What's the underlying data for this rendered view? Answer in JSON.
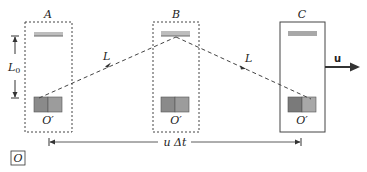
{
  "diagram": {
    "frames": [
      {
        "label": "A",
        "clock_label": "O′",
        "border": "dashed"
      },
      {
        "label": "B",
        "clock_label": "O′",
        "border": "dashed"
      },
      {
        "label": "C",
        "clock_label": "O′",
        "border": "solid"
      }
    ],
    "path_labels": [
      "L",
      "L"
    ],
    "height_label": "L",
    "height_subscript": "0",
    "velocity_label": "u",
    "displacement_label": "u Δt",
    "observer_label": "O",
    "colors": {
      "mirror": "#bdbdbd",
      "mirror_edge": "#6a6a6a",
      "clock_dark": "#7a7a7a",
      "clock_light": "#a8a8a8",
      "line": "#333333"
    }
  }
}
